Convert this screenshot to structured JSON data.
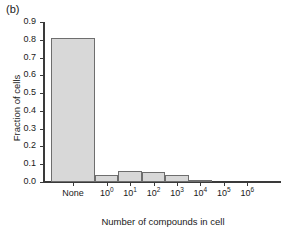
{
  "panel": {
    "label": "(b)"
  },
  "chart_data": {
    "type": "bar",
    "title": "",
    "subtitle": "",
    "xlabel": "Number of compounds in cell",
    "ylabel": "Fraction of cells",
    "categories": [
      "None",
      "10^0",
      "10^1",
      "10^2",
      "10^3",
      "10^4",
      "10^5",
      "10^6"
    ],
    "category_labels": [
      "None",
      "10",
      "10",
      "10",
      "10",
      "10",
      "10",
      "10"
    ],
    "category_exponents": [
      "",
      "0",
      "1",
      "2",
      "3",
      "4",
      "5",
      "6"
    ],
    "values": [
      0.81,
      0.04,
      0.06,
      0.055,
      0.038,
      0.012,
      0.0,
      0.0
    ],
    "ylim": [
      0.0,
      0.9
    ],
    "yticks": [
      "0.0",
      "0.1",
      "0.2",
      "0.3",
      "0.4",
      "0.5",
      "0.6",
      "0.7",
      "0.8",
      "0.9"
    ],
    "ytick_values": [
      0.0,
      0.1,
      0.2,
      0.3,
      0.4,
      0.5,
      0.6,
      0.7,
      0.8,
      0.9
    ],
    "grid": false,
    "legend": "none",
    "bar_fill": "#d8d8d8",
    "bar_edge": "#6e6e6e",
    "axis_color": "#3a3a3a"
  }
}
